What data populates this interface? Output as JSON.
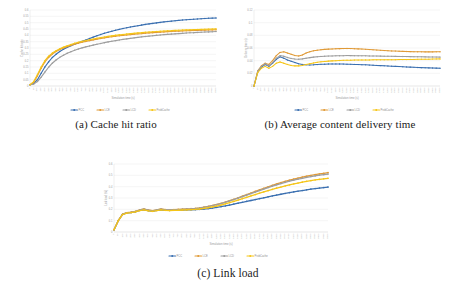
{
  "figure": {
    "background": "#ffffff",
    "series_colors": {
      "blue": "#3a6fb0",
      "orange": "#e09a37",
      "gray": "#9e9e9e",
      "yellow": "#f5c518"
    }
  },
  "panels": [
    {
      "id": "a",
      "caption": "(a) Cache hit ratio"
    },
    {
      "id": "b",
      "caption": "(b) Average content delivery time"
    },
    {
      "id": "c",
      "caption": "(c) Link load"
    }
  ],
  "chart_data": [
    {
      "type": "line",
      "title": "(a) Cache hit ratio",
      "xlabel": "Simulation time (s)",
      "ylabel": "Cache hit ratio",
      "grid": true,
      "legend_position": "bottom",
      "ylim": [
        0,
        0.6
      ],
      "yticks": [
        0,
        0.05,
        0.1,
        0.15,
        0.2,
        0.25,
        0.3,
        0.35,
        0.4,
        0.45,
        0.5,
        0.55,
        0.6
      ],
      "ytick_labels": [
        "0",
        "0.05",
        "0.1",
        "0.15",
        "0.2",
        "0.25",
        "0.3",
        "0.35",
        "0.4",
        "0.45",
        "0.5",
        "0.55",
        "0.6"
      ],
      "x": [
        0,
        50,
        100,
        150,
        200,
        250,
        300,
        350,
        400,
        450,
        500,
        550,
        600,
        650,
        700,
        750,
        800,
        850,
        900,
        950,
        1000,
        1050,
        1100,
        1150,
        1200,
        1250,
        1300,
        1350,
        1400,
        1450,
        1500,
        1550,
        1600,
        1650,
        1700,
        1750,
        1800,
        1850,
        1900,
        1950,
        2000,
        2050,
        2100,
        2150,
        2200,
        2250,
        2300,
        2350,
        2400,
        2450,
        2500
      ],
      "xtick_labels": [
        "0",
        "50",
        "100",
        "150",
        "200",
        "250",
        "300",
        "350",
        "400",
        "450",
        "500",
        "550",
        "600",
        "650",
        "700",
        "750",
        "800",
        "850",
        "900",
        "950",
        "1000",
        "1050",
        "1100",
        "1150",
        "1200",
        "1250",
        "1300",
        "1350",
        "1400",
        "1450",
        "1500",
        "1550",
        "1600",
        "1650",
        "1700",
        "1750",
        "1800",
        "1850",
        "1900",
        "1950",
        "2000",
        "2050",
        "2100",
        "2150",
        "2200",
        "2250",
        "2300",
        "2350",
        "2400",
        "2450",
        "2500"
      ],
      "series": [
        {
          "name": "PCC",
          "color": "#3a6fb0",
          "values": [
            0.01,
            0.02,
            0.05,
            0.1,
            0.15,
            0.19,
            0.225,
            0.25,
            0.272,
            0.29,
            0.305,
            0.318,
            0.33,
            0.341,
            0.352,
            0.363,
            0.375,
            0.386,
            0.397,
            0.407,
            0.416,
            0.424,
            0.432,
            0.44,
            0.447,
            0.454,
            0.46,
            0.466,
            0.471,
            0.476,
            0.481,
            0.486,
            0.49,
            0.494,
            0.498,
            0.502,
            0.506,
            0.509,
            0.512,
            0.515,
            0.518,
            0.521,
            0.523,
            0.525,
            0.527,
            0.529,
            0.531,
            0.533,
            0.535,
            0.536,
            0.537
          ]
        },
        {
          "name": "LCE",
          "color": "#e09a37",
          "values": [
            0.01,
            0.03,
            0.08,
            0.14,
            0.19,
            0.225,
            0.252,
            0.272,
            0.288,
            0.3,
            0.311,
            0.321,
            0.33,
            0.338,
            0.345,
            0.352,
            0.358,
            0.364,
            0.37,
            0.375,
            0.38,
            0.385,
            0.389,
            0.393,
            0.397,
            0.4,
            0.403,
            0.406,
            0.409,
            0.412,
            0.414,
            0.417,
            0.419,
            0.421,
            0.423,
            0.425,
            0.427,
            0.429,
            0.43,
            0.432,
            0.433,
            0.435,
            0.436,
            0.437,
            0.438,
            0.439,
            0.44,
            0.441,
            0.442,
            0.443,
            0.444
          ]
        },
        {
          "name": "LCD",
          "color": "#9e9e9e",
          "values": [
            0.01,
            0.015,
            0.035,
            0.07,
            0.11,
            0.148,
            0.18,
            0.205,
            0.226,
            0.243,
            0.258,
            0.271,
            0.282,
            0.292,
            0.301,
            0.309,
            0.316,
            0.323,
            0.33,
            0.336,
            0.342,
            0.348,
            0.353,
            0.358,
            0.363,
            0.368,
            0.372,
            0.376,
            0.38,
            0.384,
            0.388,
            0.391,
            0.394,
            0.397,
            0.4,
            0.403,
            0.406,
            0.408,
            0.41,
            0.412,
            0.414,
            0.416,
            0.418,
            0.42,
            0.421,
            0.423,
            0.424,
            0.426,
            0.427,
            0.428,
            0.43
          ]
        },
        {
          "name": "ProbCache",
          "color": "#f5c518",
          "values": [
            0.01,
            0.035,
            0.09,
            0.15,
            0.2,
            0.235,
            0.26,
            0.279,
            0.294,
            0.307,
            0.318,
            0.328,
            0.337,
            0.345,
            0.352,
            0.359,
            0.365,
            0.371,
            0.377,
            0.382,
            0.387,
            0.392,
            0.396,
            0.4,
            0.404,
            0.407,
            0.41,
            0.413,
            0.416,
            0.419,
            0.421,
            0.424,
            0.426,
            0.428,
            0.43,
            0.432,
            0.434,
            0.436,
            0.437,
            0.439,
            0.44,
            0.442,
            0.443,
            0.444,
            0.445,
            0.446,
            0.447,
            0.448,
            0.449,
            0.45,
            0.451
          ]
        }
      ]
    },
    {
      "type": "line",
      "title": "(b) Average content delivery time",
      "xlabel": "Simulation time (s)",
      "ylabel": "Delivery time (s)",
      "grid": true,
      "legend_position": "bottom",
      "ylim": [
        0,
        0.12
      ],
      "yticks": [
        0,
        0.02,
        0.04,
        0.06,
        0.08,
        0.1,
        0.12
      ],
      "ytick_labels": [
        "0",
        "0.02",
        "0.04",
        "0.06",
        "0.08",
        "0.1",
        "0.12"
      ],
      "x": [
        0,
        50,
        100,
        150,
        200,
        250,
        300,
        350,
        400,
        450,
        500,
        550,
        600,
        650,
        700,
        750,
        800,
        850,
        900,
        950,
        1000,
        1050,
        1100,
        1150,
        1200,
        1250,
        1300,
        1350,
        1400,
        1450,
        1500,
        1550,
        1600,
        1650,
        1700,
        1750,
        1800,
        1850,
        1900,
        1950,
        2000,
        2050,
        2100,
        2150,
        2200,
        2250,
        2300,
        2350,
        2400,
        2450,
        2500
      ],
      "xtick_labels": [
        "0",
        "50",
        "100",
        "150",
        "200",
        "250",
        "300",
        "350",
        "400",
        "450",
        "500",
        "550",
        "600",
        "650",
        "700",
        "750",
        "800",
        "850",
        "900",
        "950",
        "1000",
        "1050",
        "1100",
        "1150",
        "1200",
        "1250",
        "1300",
        "1350",
        "1400",
        "1450",
        "1500",
        "1550",
        "1600",
        "1650",
        "1700",
        "1750",
        "1800",
        "1850",
        "1900",
        "1950",
        "2000",
        "2050",
        "2100",
        "2150",
        "2200",
        "2250",
        "2300",
        "2350",
        "2400",
        "2450",
        "2500"
      ],
      "series": [
        {
          "name": "PCC",
          "color": "#3a6fb0",
          "values": [
            0.0,
            0.022,
            0.03,
            0.034,
            0.031,
            0.036,
            0.042,
            0.046,
            0.044,
            0.041,
            0.039,
            0.037,
            0.035,
            0.034,
            0.0335,
            0.0332,
            0.0334,
            0.0338,
            0.0342,
            0.0345,
            0.0347,
            0.0348,
            0.0348,
            0.0347,
            0.0346,
            0.0345,
            0.0343,
            0.0341,
            0.0339,
            0.0337,
            0.0334,
            0.0331,
            0.0328,
            0.0325,
            0.0322,
            0.0319,
            0.0316,
            0.0313,
            0.031,
            0.0307,
            0.0304,
            0.0301,
            0.0298,
            0.0295,
            0.0292,
            0.029,
            0.0288,
            0.0286,
            0.0284,
            0.0282,
            0.028
          ]
        },
        {
          "name": "LCE",
          "color": "#e09a37",
          "values": [
            0.0,
            0.024,
            0.032,
            0.036,
            0.034,
            0.04,
            0.048,
            0.053,
            0.054,
            0.052,
            0.05,
            0.048,
            0.0475,
            0.049,
            0.052,
            0.054,
            0.0555,
            0.0565,
            0.0572,
            0.0578,
            0.0582,
            0.0585,
            0.0588,
            0.059,
            0.0591,
            0.0592,
            0.0591,
            0.0589,
            0.0586,
            0.0583,
            0.0579,
            0.0575,
            0.0571,
            0.0567,
            0.0563,
            0.056,
            0.0557,
            0.0554,
            0.0551,
            0.0549,
            0.0547,
            0.0545,
            0.0543,
            0.0542,
            0.0541,
            0.054,
            0.0539,
            0.0539,
            0.0539,
            0.054,
            0.0541
          ]
        },
        {
          "name": "LCD",
          "color": "#9e9e9e",
          "values": [
            0.0,
            0.023,
            0.031,
            0.035,
            0.032,
            0.037,
            0.044,
            0.048,
            0.047,
            0.045,
            0.0435,
            0.0425,
            0.0422,
            0.0428,
            0.0438,
            0.0448,
            0.0456,
            0.0462,
            0.0467,
            0.047,
            0.0473,
            0.0475,
            0.0477,
            0.0478,
            0.0479,
            0.048,
            0.048,
            0.0479,
            0.0478,
            0.0477,
            0.0476,
            0.0475,
            0.0474,
            0.0473,
            0.0472,
            0.0471,
            0.047,
            0.0469,
            0.0468,
            0.0467,
            0.0466,
            0.0465,
            0.0464,
            0.0463,
            0.0462,
            0.0461,
            0.046,
            0.0459,
            0.0458,
            0.0457,
            0.0456
          ]
        },
        {
          "name": "ProbCache",
          "color": "#f5c518",
          "values": [
            0.0,
            0.021,
            0.028,
            0.031,
            0.028,
            0.031,
            0.036,
            0.038,
            0.036,
            0.034,
            0.0325,
            0.0318,
            0.0318,
            0.0325,
            0.0338,
            0.0352,
            0.0364,
            0.0374,
            0.0382,
            0.0388,
            0.0393,
            0.0397,
            0.04,
            0.0403,
            0.0405,
            0.0407,
            0.0408,
            0.0409,
            0.041,
            0.0411,
            0.0412,
            0.0412,
            0.0413,
            0.0413,
            0.0414,
            0.0414,
            0.0415,
            0.0415,
            0.0416,
            0.0417,
            0.0417,
            0.0418,
            0.0419,
            0.042,
            0.0421,
            0.0422,
            0.0423,
            0.0424,
            0.0425,
            0.0427,
            0.0428
          ]
        }
      ]
    },
    {
      "type": "line",
      "title": "(c) Link load",
      "xlabel": "Simulation time (s)",
      "ylabel": "Link load (%)",
      "grid": true,
      "legend_position": "bottom",
      "ylim": [
        0,
        0.6
      ],
      "yticks": [
        0,
        0.1,
        0.2,
        0.3,
        0.4,
        0.5,
        0.6
      ],
      "ytick_labels": [
        "0",
        "0.1",
        "0.2",
        "0.3",
        "0.4",
        "0.5",
        "0.6"
      ],
      "x": [
        0,
        50,
        100,
        150,
        200,
        250,
        300,
        350,
        400,
        450,
        500,
        550,
        600,
        650,
        700,
        750,
        800,
        850,
        900,
        950,
        1000,
        1050,
        1100,
        1150,
        1200,
        1250,
        1300,
        1350,
        1400,
        1450,
        1500,
        1550,
        1600,
        1650,
        1700,
        1750,
        1800,
        1850,
        1900,
        1950,
        2000,
        2050,
        2100,
        2150,
        2200,
        2250,
        2300,
        2350,
        2400,
        2450,
        2500
      ],
      "xtick_labels": [
        "0",
        "50",
        "100",
        "150",
        "200",
        "250",
        "300",
        "350",
        "400",
        "450",
        "500",
        "550",
        "600",
        "650",
        "700",
        "750",
        "800",
        "850",
        "900",
        "950",
        "1000",
        "1050",
        "1100",
        "1150",
        "1200",
        "1250",
        "1300",
        "1350",
        "1400",
        "1450",
        "1500",
        "1550",
        "1600",
        "1650",
        "1700",
        "1750",
        "1800",
        "1850",
        "1900",
        "1950",
        "2000",
        "2050",
        "2100",
        "2150",
        "2200",
        "2250",
        "2300",
        "2350",
        "2400",
        "2450",
        "2500"
      ],
      "series": [
        {
          "name": "PCC",
          "color": "#3a6fb0",
          "values": [
            0.02,
            0.1,
            0.155,
            0.168,
            0.172,
            0.178,
            0.19,
            0.196,
            0.188,
            0.183,
            0.19,
            0.196,
            0.192,
            0.19,
            0.192,
            0.193,
            0.194,
            0.195,
            0.196,
            0.197,
            0.199,
            0.202,
            0.206,
            0.211,
            0.217,
            0.223,
            0.23,
            0.238,
            0.246,
            0.254,
            0.262,
            0.27,
            0.278,
            0.286,
            0.294,
            0.302,
            0.31,
            0.318,
            0.326,
            0.333,
            0.34,
            0.347,
            0.354,
            0.36,
            0.366,
            0.372,
            0.378,
            0.383,
            0.388,
            0.392,
            0.396
          ]
        },
        {
          "name": "LCE",
          "color": "#e09a37",
          "values": [
            0.02,
            0.1,
            0.157,
            0.17,
            0.175,
            0.182,
            0.196,
            0.203,
            0.194,
            0.188,
            0.196,
            0.203,
            0.198,
            0.196,
            0.198,
            0.2,
            0.202,
            0.204,
            0.206,
            0.209,
            0.213,
            0.219,
            0.226,
            0.234,
            0.243,
            0.253,
            0.264,
            0.276,
            0.289,
            0.302,
            0.316,
            0.33,
            0.344,
            0.358,
            0.372,
            0.386,
            0.399,
            0.412,
            0.424,
            0.436,
            0.447,
            0.457,
            0.467,
            0.476,
            0.484,
            0.492,
            0.499,
            0.506,
            0.512,
            0.518,
            0.524
          ]
        },
        {
          "name": "LCD",
          "color": "#9e9e9e",
          "values": [
            0.02,
            0.1,
            0.156,
            0.169,
            0.174,
            0.181,
            0.194,
            0.201,
            0.192,
            0.186,
            0.194,
            0.201,
            0.196,
            0.194,
            0.196,
            0.198,
            0.2,
            0.202,
            0.204,
            0.207,
            0.211,
            0.217,
            0.224,
            0.232,
            0.241,
            0.251,
            0.262,
            0.274,
            0.286,
            0.299,
            0.312,
            0.326,
            0.339,
            0.352,
            0.366,
            0.379,
            0.392,
            0.404,
            0.416,
            0.427,
            0.438,
            0.448,
            0.457,
            0.466,
            0.474,
            0.482,
            0.489,
            0.495,
            0.501,
            0.506,
            0.511
          ]
        },
        {
          "name": "ProbCache",
          "color": "#f5c518",
          "values": [
            0.02,
            0.1,
            0.154,
            0.167,
            0.171,
            0.177,
            0.189,
            0.195,
            0.187,
            0.182,
            0.189,
            0.195,
            0.191,
            0.189,
            0.191,
            0.192,
            0.194,
            0.195,
            0.197,
            0.199,
            0.203,
            0.208,
            0.214,
            0.221,
            0.229,
            0.238,
            0.248,
            0.259,
            0.27,
            0.282,
            0.294,
            0.306,
            0.318,
            0.33,
            0.342,
            0.354,
            0.365,
            0.376,
            0.387,
            0.397,
            0.406,
            0.415,
            0.424,
            0.432,
            0.44,
            0.447,
            0.453,
            0.459,
            0.464,
            0.469,
            0.474
          ]
        }
      ]
    }
  ]
}
